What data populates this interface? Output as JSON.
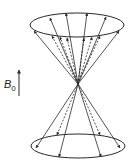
{
  "diagram": {
    "field_label": {
      "main": "B",
      "subscript": "0"
    },
    "colors": {
      "stroke": "#2a2a2a",
      "background": "#ffffff"
    },
    "upper_cone": {
      "solid_vectors": 6,
      "dashed_vectors": 6
    },
    "lower_cone": {
      "solid_vectors": 4,
      "dashed_vectors": 2
    }
  }
}
